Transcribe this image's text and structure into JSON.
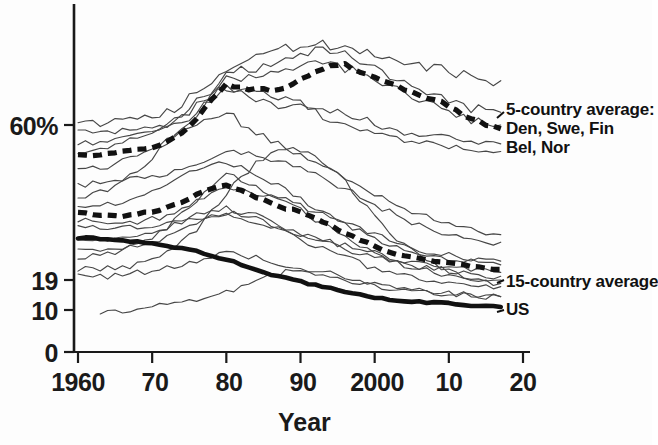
{
  "chart_data": {
    "type": "line",
    "title": "",
    "xlabel": "Year",
    "ylabel": "",
    "xlim": [
      1960,
      2020
    ],
    "ylim": [
      0,
      75
    ],
    "grid": false,
    "legend_position": "right-inline-annotations",
    "x_ticks": [
      {
        "value": 1960,
        "label": "1960"
      },
      {
        "value": 1970,
        "label": "70"
      },
      {
        "value": 1980,
        "label": "80"
      },
      {
        "value": 1990,
        "label": "90"
      },
      {
        "value": 2000,
        "label": "2000"
      },
      {
        "value": 2010,
        "label": "10"
      },
      {
        "value": 2020,
        "label": "20"
      }
    ],
    "y_ticks": [
      {
        "value": 60,
        "label": "60%"
      },
      {
        "value": 19,
        "label": "19"
      },
      {
        "value": 10,
        "label": "10"
      },
      {
        "value": 0,
        "label": "0"
      }
    ],
    "y_axis_note": "Nonlinear / compressed axis: 0, 10, 19, 60% tick spacing is irregular",
    "annotations": [
      {
        "id": "five_country",
        "text": "5-country average:\nDen, Swe, Fin\nBel, Nor",
        "x": 2021,
        "y": 58
      },
      {
        "id": "fifteen_country",
        "text": "15-country average",
        "x": 2021,
        "y": 22
      },
      {
        "id": "us",
        "text": "US",
        "x": 2021,
        "y": 13
      }
    ],
    "series": [
      {
        "name": "5-country average",
        "style": "thick-dashed",
        "color": "#111111",
        "x": [
          1960,
          1962,
          1964,
          1966,
          1968,
          1970,
          1972,
          1974,
          1976,
          1978,
          1980,
          1982,
          1984,
          1986,
          1988,
          1990,
          1992,
          1994,
          1996,
          1998,
          2000,
          2002,
          2004,
          2006,
          2008,
          2010,
          2012,
          2014,
          2016,
          2017
        ],
        "values": [
          52,
          52,
          52.5,
          53,
          53.5,
          54,
          55.5,
          58,
          61,
          64,
          66.5,
          66,
          65.5,
          65.5,
          66,
          67,
          68.5,
          69.5,
          69.5,
          68.5,
          67.5,
          66.5,
          65.5,
          64.5,
          64,
          63,
          61.5,
          60.5,
          59.5,
          59
        ]
      },
      {
        "name": "15-country average",
        "style": "thick-dashed",
        "color": "#111111",
        "x": [
          1960,
          1962,
          1964,
          1966,
          1968,
          1970,
          1972,
          1974,
          1976,
          1978,
          1980,
          1982,
          1984,
          1986,
          1988,
          1990,
          1992,
          1994,
          1996,
          1998,
          2000,
          2002,
          2004,
          2006,
          2008,
          2010,
          2012,
          2014,
          2016,
          2017
        ],
        "values": [
          37,
          36.5,
          36,
          36,
          36.5,
          37,
          38,
          39.5,
          41.5,
          43,
          44,
          42.5,
          41,
          39.5,
          38,
          37,
          35.5,
          33.5,
          31.5,
          29.5,
          28,
          26.5,
          25.5,
          24.5,
          24,
          23.5,
          23,
          22.5,
          22,
          21.8
        ]
      },
      {
        "name": "US",
        "style": "thick-solid",
        "color": "#111111",
        "x": [
          1960,
          1962,
          1964,
          1966,
          1968,
          1970,
          1972,
          1974,
          1976,
          1978,
          1980,
          1982,
          1984,
          1986,
          1988,
          1990,
          1992,
          1994,
          1996,
          1998,
          2000,
          2002,
          2004,
          2006,
          2008,
          2010,
          2012,
          2014,
          2016,
          2017
        ],
        "values": [
          30,
          30,
          30,
          29.5,
          29,
          28.5,
          28,
          27.5,
          26.5,
          25.5,
          24.5,
          23,
          21.5,
          20.5,
          19.5,
          18.5,
          17.5,
          16.5,
          15.5,
          14.5,
          13.8,
          13.2,
          12.8,
          12.4,
          12.2,
          12,
          11.5,
          11.2,
          11,
          10.9
        ]
      },
      {
        "name": "country-line-1",
        "style": "thin",
        "color": "#4a4a4a",
        "x": [
          1960,
          1964,
          1968,
          1972,
          1976,
          1980,
          1984,
          1988,
          1992,
          1996,
          2000,
          2004,
          2008,
          2012,
          2016,
          2017
        ],
        "values": [
          60,
          60,
          61,
          62,
          65,
          69,
          71,
          72,
          73,
          72,
          71,
          70,
          69,
          68,
          67,
          67
        ]
      },
      {
        "name": "country-line-2",
        "style": "thin",
        "color": "#4a4a4a",
        "x": [
          1960,
          1964,
          1968,
          1972,
          1976,
          1980,
          1984,
          1988,
          1992,
          1996,
          2000,
          2004,
          2008,
          2012,
          2016,
          2017
        ],
        "values": [
          40,
          43,
          48,
          55,
          62,
          68,
          69,
          70,
          72,
          71,
          69,
          67,
          65,
          63,
          62,
          62
        ]
      },
      {
        "name": "country-line-3",
        "style": "thin",
        "color": "#4a4a4a",
        "x": [
          1960,
          1964,
          1968,
          1972,
          1976,
          1980,
          1984,
          1988,
          1992,
          1996,
          2000,
          2004,
          2008,
          2012,
          2016,
          2017
        ],
        "values": [
          55,
          56,
          57,
          59,
          62,
          66,
          64,
          63,
          62,
          60,
          58,
          56,
          55,
          54,
          53,
          53
        ]
      },
      {
        "name": "country-line-4",
        "style": "thin",
        "color": "#4a4a4a",
        "x": [
          1960,
          1964,
          1968,
          1972,
          1976,
          1980,
          1984,
          1988,
          1992,
          1996,
          2000,
          2004,
          2008,
          2012,
          2016,
          2017
        ],
        "values": [
          48,
          49,
          52,
          56,
          60,
          62,
          58,
          54,
          50,
          46,
          42,
          38,
          35,
          33,
          31,
          31
        ]
      },
      {
        "name": "country-line-5",
        "style": "thin",
        "color": "#4a4a4a",
        "x": [
          1960,
          1964,
          1968,
          1972,
          1976,
          1980,
          1984,
          1988,
          1992,
          1996,
          2000,
          2004,
          2008,
          2012,
          2016,
          2017
        ],
        "values": [
          44,
          45,
          46,
          47,
          50,
          53,
          52,
          50,
          47,
          43,
          39,
          35,
          32,
          30,
          29,
          29
        ]
      },
      {
        "name": "country-line-6",
        "style": "thin",
        "color": "#4a4a4a",
        "x": [
          1960,
          1964,
          1968,
          1972,
          1976,
          1980,
          1984,
          1988,
          1992,
          1996,
          2000,
          2004,
          2008,
          2012,
          2016,
          2017
        ],
        "values": [
          38,
          39,
          41,
          44,
          48,
          50,
          47,
          43,
          38,
          34,
          30,
          27,
          25,
          24,
          23,
          23
        ]
      },
      {
        "name": "country-line-7",
        "style": "thin",
        "color": "#4a4a4a",
        "x": [
          1960,
          1964,
          1968,
          1972,
          1976,
          1980,
          1984,
          1988,
          1992,
          1996,
          2000,
          2004,
          2008,
          2012,
          2016,
          2017
        ],
        "values": [
          35,
          34,
          34,
          36,
          40,
          44,
          42,
          40,
          37,
          34,
          31,
          28,
          26,
          25,
          24,
          24
        ]
      },
      {
        "name": "country-line-8",
        "style": "thin",
        "color": "#4a4a4a",
        "x": [
          1960,
          1964,
          1968,
          1972,
          1976,
          1980,
          1984,
          1988,
          1992,
          1996,
          2000,
          2004,
          2008,
          2012,
          2016,
          2017
        ],
        "values": [
          33,
          33,
          33,
          34,
          35,
          36,
          34,
          32,
          30,
          28,
          26,
          24,
          23,
          22,
          21,
          21
        ]
      },
      {
        "name": "country-line-9",
        "style": "thin",
        "color": "#4a4a4a",
        "x": [
          1960,
          1964,
          1968,
          1972,
          1976,
          1980,
          1984,
          1988,
          1992,
          1996,
          2000,
          2004,
          2008,
          2012,
          2016,
          2017
        ],
        "values": [
          30,
          30,
          31,
          33,
          36,
          38,
          36,
          33,
          30,
          27,
          25,
          23,
          22,
          21,
          20,
          20
        ]
      },
      {
        "name": "country-line-10",
        "style": "thin",
        "color": "#4a4a4a",
        "x": [
          1960,
          1964,
          1968,
          1972,
          1976,
          1980,
          1984,
          1988,
          1992,
          1996,
          2000,
          2004,
          2008,
          2012,
          2016,
          2017
        ],
        "values": [
          27,
          27,
          28,
          30,
          34,
          37,
          35,
          32,
          28,
          25,
          22,
          20,
          19,
          18,
          17,
          17
        ]
      },
      {
        "name": "country-line-11",
        "style": "thin",
        "color": "#4a4a4a",
        "x": [
          1960,
          1964,
          1968,
          1972,
          1976,
          1980,
          1984,
          1988,
          1992,
          1996,
          2000,
          2004,
          2008,
          2012,
          2016,
          2017
        ],
        "values": [
          25,
          26,
          28,
          33,
          40,
          47,
          44,
          40,
          35,
          30,
          26,
          23,
          21,
          20,
          19,
          19
        ]
      },
      {
        "name": "country-line-12",
        "style": "thin",
        "color": "#4a4a4a",
        "x": [
          1960,
          1964,
          1968,
          1972,
          1976,
          1980,
          1984,
          1988,
          1992,
          1996,
          2000,
          2004,
          2008,
          2012,
          2016,
          2017
        ],
        "values": [
          22,
          22,
          23,
          26,
          32,
          42,
          50,
          54,
          52,
          45,
          36,
          28,
          23,
          20,
          18,
          18
        ]
      },
      {
        "name": "country-line-13",
        "style": "thin",
        "color": "#4a4a4a",
        "x": [
          1960,
          1964,
          1968,
          1972,
          1976,
          1980,
          1984,
          1988,
          1992,
          1996,
          2000,
          2004,
          2008,
          2012,
          2016,
          2017
        ],
        "values": [
          20,
          20,
          21,
          22,
          24,
          26,
          25,
          23,
          21,
          19,
          17,
          16,
          15,
          15,
          14,
          14
        ]
      },
      {
        "name": "country-line-14",
        "style": "thin",
        "color": "#4a4a4a",
        "x": [
          1963,
          1966,
          1970,
          1974,
          1978,
          1982,
          1986,
          1990,
          1994,
          1998,
          2002,
          2006,
          2010,
          2014,
          2017
        ],
        "values": [
          9,
          10,
          11,
          12,
          14,
          17,
          20,
          22,
          21,
          19,
          17,
          16,
          15,
          14,
          14
        ]
      },
      {
        "name": "country-line-15",
        "style": "thin",
        "color": "#4a4a4a",
        "x": [
          1960,
          1964,
          1968,
          1972,
          1976,
          1980,
          1984,
          1988,
          1992,
          1996,
          2000,
          2004,
          2008,
          2012,
          2016,
          2017
        ],
        "values": [
          52,
          54,
          57,
          60,
          64,
          67,
          68,
          69,
          70,
          69,
          67,
          65,
          63,
          61,
          60,
          60
        ]
      },
      {
        "name": "country-line-16",
        "style": "thin",
        "color": "#4a4a4a",
        "x": [
          1960,
          1964,
          1968,
          1972,
          1976,
          1980,
          1984,
          1988,
          1992,
          1996,
          2000,
          2004,
          2008,
          2012,
          2016,
          2017
        ],
        "values": [
          58,
          58,
          59,
          60,
          63,
          66,
          65,
          64,
          63,
          62,
          60,
          58,
          57,
          56,
          55,
          55
        ]
      }
    ]
  },
  "axis": {
    "y_labels": [
      "60%",
      "19",
      "10",
      "0"
    ],
    "x_labels": [
      "1960",
      "70",
      "80",
      "90",
      "2000",
      "10",
      "20"
    ],
    "x_title": "Year"
  },
  "annotations": {
    "five_country_l1": "5-country average:",
    "five_country_l2": "Den, Swe, Fin",
    "five_country_l3": "Bel, Nor",
    "fifteen_country": "15-country average",
    "us": "US"
  }
}
